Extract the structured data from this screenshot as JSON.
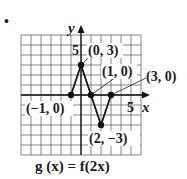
{
  "bullet": "•",
  "chart_data": {
    "type": "line",
    "title": "g (x) = f(2x)",
    "xlabel": "x",
    "ylabel": "y",
    "xlim": [
      -6,
      6
    ],
    "ylim": [
      -6,
      6
    ],
    "grid": true,
    "tick_labels": {
      "x": [
        "5"
      ],
      "y": [
        "5"
      ]
    },
    "series": [
      {
        "name": "g(x)",
        "points": [
          [
            -1,
            0
          ],
          [
            0,
            3
          ],
          [
            1,
            0
          ],
          [
            2,
            -3
          ],
          [
            3,
            0
          ]
        ]
      }
    ],
    "annotations": [
      {
        "point": [
          0,
          3
        ],
        "text": "(0, 3)"
      },
      {
        "point": [
          1,
          0
        ],
        "text": "(1, 0)"
      },
      {
        "point": [
          3,
          0
        ],
        "text": "(3, 0)"
      },
      {
        "point": [
          -1,
          0
        ],
        "text": "(−1, 0)"
      },
      {
        "point": [
          2,
          -3
        ],
        "text": "(2, −3)"
      }
    ]
  },
  "labels": {
    "y_axis": "y",
    "x_axis": "x",
    "y_tick": "5",
    "x_tick": "5",
    "p03": "(0, 3)",
    "p10": "(1, 0)",
    "p30": "(3, 0)",
    "pm10": "(−1, 0)",
    "p2m3": "(2, −3)",
    "formula": "g (x) = f(2x)"
  }
}
